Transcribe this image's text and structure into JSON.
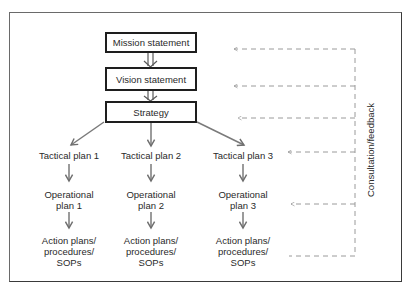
{
  "diagram": {
    "top_boxes": {
      "mission": "Mission statement",
      "vision": "Vision statement",
      "strategy": "Strategy"
    },
    "columns": [
      {
        "tactical": "Tactical plan 1",
        "operational_line1": "Operational",
        "operational_line2": "plan 1",
        "action_line1": "Action plans/",
        "action_line2": "procedures/",
        "action_line3": "SOPs"
      },
      {
        "tactical": "Tactical plan 2",
        "operational_line1": "Operational",
        "operational_line2": "plan 2",
        "action_line1": "Action plans/",
        "action_line2": "procedures/",
        "action_line3": "SOPs"
      },
      {
        "tactical": "Tactical plan 3",
        "operational_line1": "Operational",
        "operational_line2": "plan 3",
        "action_line1": "Action plans/",
        "action_line2": "procedures/",
        "action_line3": "SOPs"
      }
    ],
    "feedback_label": "Consultation/feedback",
    "colors": {
      "box_border": "#1e1e1e",
      "arrow": "#7a7a7a",
      "dashed": "#9a9a9a",
      "frame": "#5a5a5a"
    }
  }
}
